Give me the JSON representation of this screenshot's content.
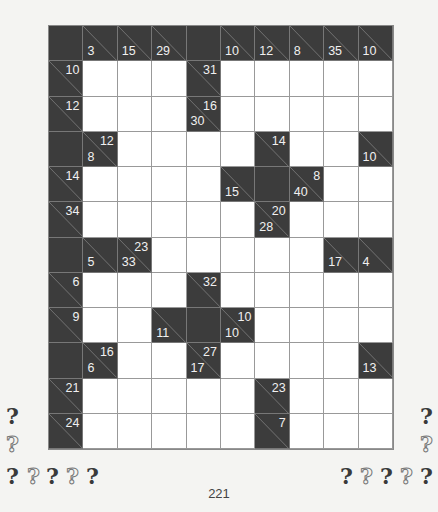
{
  "puzzle": {
    "type": "kakuro",
    "cols": 10,
    "rows": 12,
    "colors": {
      "black": "#3c3c3c",
      "white": "#ffffff",
      "clue_text": "#f0f0f0",
      "grid_line": "#999999"
    },
    "grid": [
      [
        {
          "t": "b"
        },
        {
          "t": "c",
          "d": "3"
        },
        {
          "t": "c",
          "d": "15"
        },
        {
          "t": "c",
          "d": "29"
        },
        {
          "t": "b"
        },
        {
          "t": "c",
          "d": "10"
        },
        {
          "t": "c",
          "d": "12"
        },
        {
          "t": "c",
          "d": "8"
        },
        {
          "t": "c",
          "d": "35"
        },
        {
          "t": "c",
          "d": "10"
        }
      ],
      [
        {
          "t": "c",
          "r": "10"
        },
        {
          "t": "w"
        },
        {
          "t": "w"
        },
        {
          "t": "w"
        },
        {
          "t": "c",
          "r": "31"
        },
        {
          "t": "w"
        },
        {
          "t": "w"
        },
        {
          "t": "w"
        },
        {
          "t": "w"
        },
        {
          "t": "w"
        }
      ],
      [
        {
          "t": "c",
          "r": "12"
        },
        {
          "t": "w"
        },
        {
          "t": "w"
        },
        {
          "t": "w"
        },
        {
          "t": "c",
          "r": "16",
          "d": "30"
        },
        {
          "t": "w"
        },
        {
          "t": "w"
        },
        {
          "t": "w"
        },
        {
          "t": "w"
        },
        {
          "t": "w"
        }
      ],
      [
        {
          "t": "b"
        },
        {
          "t": "c",
          "r": "12",
          "d": "8"
        },
        {
          "t": "w"
        },
        {
          "t": "w"
        },
        {
          "t": "w"
        },
        {
          "t": "w"
        },
        {
          "t": "c",
          "r": "14"
        },
        {
          "t": "w"
        },
        {
          "t": "w"
        },
        {
          "t": "c",
          "d": "10"
        }
      ],
      [
        {
          "t": "c",
          "r": "14"
        },
        {
          "t": "w"
        },
        {
          "t": "w"
        },
        {
          "t": "w"
        },
        {
          "t": "w"
        },
        {
          "t": "c",
          "d": "15"
        },
        {
          "t": "b"
        },
        {
          "t": "c",
          "r": "8",
          "d": "40"
        },
        {
          "t": "w"
        },
        {
          "t": "w"
        }
      ],
      [
        {
          "t": "c",
          "r": "34"
        },
        {
          "t": "w"
        },
        {
          "t": "w"
        },
        {
          "t": "w"
        },
        {
          "t": "w"
        },
        {
          "t": "w"
        },
        {
          "t": "c",
          "r": "20",
          "d": "28"
        },
        {
          "t": "w"
        },
        {
          "t": "w"
        },
        {
          "t": "w"
        }
      ],
      [
        {
          "t": "b"
        },
        {
          "t": "c",
          "d": "5"
        },
        {
          "t": "c",
          "r": "23",
          "d": "33"
        },
        {
          "t": "w"
        },
        {
          "t": "w"
        },
        {
          "t": "w"
        },
        {
          "t": "w"
        },
        {
          "t": "w"
        },
        {
          "t": "c",
          "d": "17"
        },
        {
          "t": "c",
          "d": "4"
        }
      ],
      [
        {
          "t": "c",
          "r": "6"
        },
        {
          "t": "w"
        },
        {
          "t": "w"
        },
        {
          "t": "w"
        },
        {
          "t": "c",
          "r": "32"
        },
        {
          "t": "w"
        },
        {
          "t": "w"
        },
        {
          "t": "w"
        },
        {
          "t": "w"
        },
        {
          "t": "w"
        }
      ],
      [
        {
          "t": "c",
          "r": "9"
        },
        {
          "t": "w"
        },
        {
          "t": "w"
        },
        {
          "t": "c",
          "d": "11"
        },
        {
          "t": "b"
        },
        {
          "t": "c",
          "r": "10",
          "d": "10"
        },
        {
          "t": "w"
        },
        {
          "t": "w"
        },
        {
          "t": "w"
        },
        {
          "t": "w"
        }
      ],
      [
        {
          "t": "b"
        },
        {
          "t": "c",
          "r": "16",
          "d": "6"
        },
        {
          "t": "w"
        },
        {
          "t": "w"
        },
        {
          "t": "c",
          "r": "27",
          "d": "17"
        },
        {
          "t": "w"
        },
        {
          "t": "w"
        },
        {
          "t": "w"
        },
        {
          "t": "w"
        },
        {
          "t": "c",
          "d": "13"
        }
      ],
      [
        {
          "t": "c",
          "r": "21"
        },
        {
          "t": "w"
        },
        {
          "t": "w"
        },
        {
          "t": "w"
        },
        {
          "t": "w"
        },
        {
          "t": "w"
        },
        {
          "t": "c",
          "r": "23"
        },
        {
          "t": "w"
        },
        {
          "t": "w"
        },
        {
          "t": "w"
        }
      ],
      [
        {
          "t": "c",
          "r": "24"
        },
        {
          "t": "w"
        },
        {
          "t": "w"
        },
        {
          "t": "w"
        },
        {
          "t": "w"
        },
        {
          "t": "w"
        },
        {
          "t": "c",
          "r": "7"
        },
        {
          "t": "w"
        },
        {
          "t": "w"
        },
        {
          "t": "w"
        }
      ]
    ]
  },
  "difficulty": {
    "left": [
      {
        "style": "solid",
        "x": 6,
        "y": 405
      },
      {
        "style": "outline",
        "x": 6,
        "y": 433
      },
      {
        "style": "solid",
        "x": 6,
        "y": 465
      },
      {
        "style": "outline",
        "x": 27,
        "y": 465
      },
      {
        "style": "solid",
        "x": 46,
        "y": 465
      },
      {
        "style": "outline",
        "x": 66,
        "y": 465
      },
      {
        "style": "solid",
        "x": 86,
        "y": 465
      }
    ],
    "right": [
      {
        "style": "solid",
        "x": 420,
        "y": 405
      },
      {
        "style": "outline",
        "x": 420,
        "y": 433
      },
      {
        "style": "solid",
        "x": 340,
        "y": 465
      },
      {
        "style": "outline",
        "x": 360,
        "y": 465
      },
      {
        "style": "solid",
        "x": 380,
        "y": 465
      },
      {
        "style": "outline",
        "x": 400,
        "y": 465
      },
      {
        "style": "solid",
        "x": 420,
        "y": 465
      }
    ],
    "glyph": "?"
  },
  "page": {
    "number": "221"
  }
}
